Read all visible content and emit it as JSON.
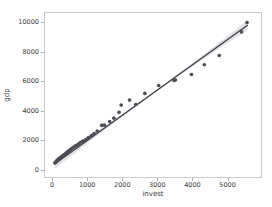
{
  "chart_data": {
    "type": "scatter",
    "title": "",
    "xlabel": "invest",
    "ylabel": "gdp",
    "xlim": [
      -230,
      5980
    ],
    "ylim": [
      -560,
      10700
    ],
    "xticks": [
      0,
      1000,
      2000,
      3000,
      4000,
      5000
    ],
    "yticks": [
      0,
      2000,
      4000,
      6000,
      8000,
      10000
    ],
    "xtick_labels": [
      "0",
      "1000",
      "2000",
      "3000",
      "4000",
      "5000"
    ],
    "ytick_labels": [
      "0",
      "2000",
      "4000",
      "6000",
      "8000",
      "10000"
    ],
    "grid": false,
    "legend": null,
    "marker_color": "#4c4c54",
    "line_color": "#3a3a44",
    "band_color": "#d8d8dc",
    "axes_color": "#c9c9c9",
    "text_color": "#3a3a3a",
    "background_color": "#ffffff",
    "regression": {
      "type": "linear-fit",
      "slope": 1.72,
      "intercept": 250,
      "has_confidence_band": true,
      "band_label": "95% confidence interval"
    },
    "points": [
      {
        "x": 55,
        "y": 400
      },
      {
        "x": 70,
        "y": 430
      },
      {
        "x": 85,
        "y": 470
      },
      {
        "x": 95,
        "y": 500
      },
      {
        "x": 110,
        "y": 530
      },
      {
        "x": 120,
        "y": 560
      },
      {
        "x": 135,
        "y": 590
      },
      {
        "x": 145,
        "y": 620
      },
      {
        "x": 160,
        "y": 650
      },
      {
        "x": 175,
        "y": 680
      },
      {
        "x": 190,
        "y": 700
      },
      {
        "x": 205,
        "y": 730
      },
      {
        "x": 220,
        "y": 760
      },
      {
        "x": 235,
        "y": 790
      },
      {
        "x": 250,
        "y": 820
      },
      {
        "x": 270,
        "y": 860
      },
      {
        "x": 290,
        "y": 900
      },
      {
        "x": 310,
        "y": 940
      },
      {
        "x": 330,
        "y": 980
      },
      {
        "x": 355,
        "y": 1030
      },
      {
        "x": 380,
        "y": 1080
      },
      {
        "x": 405,
        "y": 1130
      },
      {
        "x": 430,
        "y": 1180
      },
      {
        "x": 460,
        "y": 1240
      },
      {
        "x": 490,
        "y": 1300
      },
      {
        "x": 520,
        "y": 1360
      },
      {
        "x": 560,
        "y": 1430
      },
      {
        "x": 600,
        "y": 1500
      },
      {
        "x": 640,
        "y": 1560
      },
      {
        "x": 680,
        "y": 1620
      },
      {
        "x": 730,
        "y": 1700
      },
      {
        "x": 780,
        "y": 1790
      },
      {
        "x": 840,
        "y": 1880
      },
      {
        "x": 880,
        "y": 1900
      },
      {
        "x": 950,
        "y": 2020
      },
      {
        "x": 1020,
        "y": 2150
      },
      {
        "x": 1100,
        "y": 2280
      },
      {
        "x": 1180,
        "y": 2420
      },
      {
        "x": 1270,
        "y": 2600
      },
      {
        "x": 1400,
        "y": 2980
      },
      {
        "x": 1480,
        "y": 3000
      },
      {
        "x": 1630,
        "y": 3250
      },
      {
        "x": 1750,
        "y": 3480
      },
      {
        "x": 1900,
        "y": 3880
      },
      {
        "x": 1960,
        "y": 4380
      },
      {
        "x": 2200,
        "y": 4720
      },
      {
        "x": 2380,
        "y": 4420
      },
      {
        "x": 2640,
        "y": 5180
      },
      {
        "x": 3040,
        "y": 5720
      },
      {
        "x": 3480,
        "y": 6070
      },
      {
        "x": 3520,
        "y": 6100
      },
      {
        "x": 3980,
        "y": 6480
      },
      {
        "x": 4350,
        "y": 7150
      },
      {
        "x": 4780,
        "y": 7780
      },
      {
        "x": 5420,
        "y": 9400
      },
      {
        "x": 5580,
        "y": 10050
      }
    ]
  }
}
